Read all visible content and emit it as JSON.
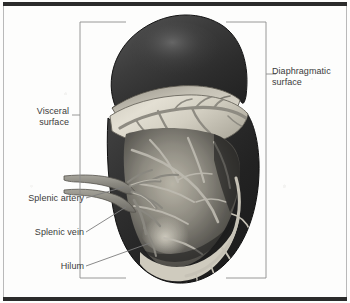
{
  "figure": {
    "background_color": "#fdfdfc",
    "rule_color": "#2b2b2b"
  },
  "labels": {
    "diaphragmatic_surface": "Diaphragmatic\nsurface",
    "visceral_surface": "Visceral\nsurface",
    "splenic_artery": "Splenic artery",
    "splenic_vein": "Splenic vein",
    "hilum": "Hilum"
  },
  "brackets": {
    "left": {
      "label": "Visceral surface",
      "x": 80,
      "top": 22,
      "bottom": 278,
      "tick_y": 115
    },
    "right": {
      "label": "Diaphragmatic surface",
      "x": 266,
      "top": 22,
      "bottom": 278,
      "tick_y": 74
    },
    "line_color": "#8d8d8d"
  },
  "leaders": [
    {
      "name": "splenic-artery-leader",
      "from_x": 86,
      "from_y": 198,
      "to_x": 124,
      "to_y": 187
    },
    {
      "name": "splenic-vein-leader",
      "from_x": 86,
      "from_y": 232,
      "to_x": 126,
      "to_y": 207
    },
    {
      "name": "hilum-leader",
      "from_x": 86,
      "from_y": 266,
      "to_x": 150,
      "to_y": 243
    }
  ],
  "anatomy": {
    "parts": [
      {
        "name": "upper-lobe-capsule",
        "description": "detached superior portion, diaphragmatic surface",
        "color": "#3a3a3a"
      },
      {
        "name": "upper-lobe-cut-surface",
        "description": "pale sectioned face of upper lobe",
        "color": "#bdb9ad"
      },
      {
        "name": "lower-body-capsule",
        "description": "main splenic body, dark capsule",
        "color": "#303030"
      },
      {
        "name": "lower-body-cut-surface",
        "description": "pale sectioned face with trabecular vessels",
        "color": "#d8d4c8"
      },
      {
        "name": "splenic-artery-vessel",
        "description": "upper stalk entering hilum",
        "color": "#8f8d86"
      },
      {
        "name": "splenic-vein-vessel",
        "description": "lower stalk entering hilum",
        "color": "#9b9990"
      },
      {
        "name": "intrasplenic-branches",
        "description": "branching vessels within parenchyma",
        "color": "#b5b2a8"
      }
    ]
  }
}
